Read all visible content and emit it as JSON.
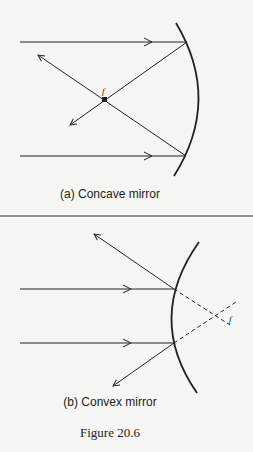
{
  "figure": {
    "caption": "Figure 20.6",
    "panels": [
      {
        "id": "a",
        "label": "(a) Concave mirror",
        "mirror_type": "concave",
        "focus_label": "f",
        "incident_rays": 2,
        "reflected_rays_converge_at_focus": true
      },
      {
        "id": "b",
        "label": "(b) Convex mirror",
        "mirror_type": "convex",
        "focus_label": "f",
        "incident_rays": 2,
        "reflected_rays_diverge_from_virtual_focus": true
      }
    ]
  },
  "colors": {
    "background": "#f6f6f4",
    "ink": "#222222"
  }
}
